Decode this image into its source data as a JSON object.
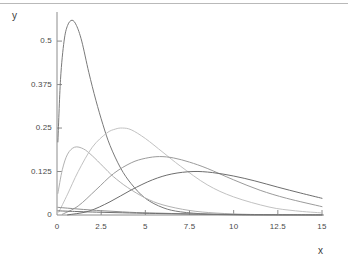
{
  "figure": {
    "background_color": "#ffffff",
    "top_rule_color": "#b9b9b9",
    "axis_color": "#8c8c8c"
  },
  "axes": {
    "x_title": "x",
    "y_title": "y",
    "x_ticks": [
      "0",
      "2.5",
      "5",
      "7.5",
      "10",
      "12.5",
      "15"
    ],
    "y_ticks": [
      "0",
      "0.125",
      "0.25",
      "0.375",
      "0.5"
    ]
  },
  "chart_data": {
    "type": "line",
    "title": "",
    "subtitle": "",
    "xlabel": "x",
    "ylabel": "y",
    "xlim": [
      0,
      15
    ],
    "ylim": [
      0,
      0.575
    ],
    "xticks": [
      0,
      2.5,
      5,
      7.5,
      10,
      12.5,
      15
    ],
    "yticks": [
      0,
      0.125,
      0.25,
      0.375,
      0.5
    ],
    "grid": false,
    "legend": "none",
    "annotations": [],
    "series": [
      {
        "name": "k = 2",
        "color": "#7a7a7a",
        "peak_x": 0.85,
        "peak_y": 0.56,
        "values_x": [
          0.05,
          0.2,
          0.4,
          0.6,
          0.85,
          1.1,
          1.4,
          1.8,
          2.2,
          2.6,
          3.0,
          3.6,
          4.2,
          5.0,
          6.0,
          7.0,
          8.5,
          10.0,
          12.0,
          15.0
        ],
        "values_y": [
          0.21,
          0.39,
          0.5,
          0.545,
          0.56,
          0.545,
          0.5,
          0.41,
          0.33,
          0.26,
          0.2,
          0.135,
          0.09,
          0.048,
          0.021,
          0.009,
          0.0026,
          0.0007,
          0.0001,
          0.0
        ]
      },
      {
        "name": "k = 3",
        "color": "#b2b2b2",
        "peak_x": 1.0,
        "peak_y": 0.242,
        "values_x": [
          0.05,
          0.3,
          0.6,
          1.0,
          1.5,
          2.0,
          2.6,
          3.2,
          4.0,
          5.0,
          6.0,
          7.5,
          9.0,
          11.0,
          13.0,
          15.0
        ],
        "values_y": [
          0.062,
          0.13,
          0.175,
          0.195,
          0.19,
          0.17,
          0.14,
          0.11,
          0.079,
          0.049,
          0.029,
          0.013,
          0.0056,
          0.0016,
          0.0004,
          0.0001
        ]
      },
      {
        "name": "k = 5",
        "color": "#c2c2c2",
        "peak_x": 3.7,
        "peak_y": 0.25,
        "values_x": [
          0.1,
          0.6,
          1.2,
          2.0,
          2.8,
          3.3,
          3.7,
          4.2,
          5.0,
          6.0,
          7.0,
          8.5,
          10.0,
          12.0,
          13.5,
          15.0
        ],
        "values_y": [
          0.008,
          0.06,
          0.125,
          0.195,
          0.235,
          0.247,
          0.25,
          0.245,
          0.22,
          0.18,
          0.14,
          0.087,
          0.052,
          0.023,
          0.012,
          0.006
        ]
      },
      {
        "name": "k = 7",
        "color": "#9b9b9b",
        "peak_x": 5.8,
        "peak_y": 0.168,
        "values_x": [
          0.3,
          1.2,
          2.2,
          3.2,
          4.2,
          5.0,
          5.8,
          6.6,
          7.5,
          8.5,
          10.0,
          11.5,
          13.0,
          15.0
        ],
        "values_y": [
          0.002,
          0.026,
          0.072,
          0.119,
          0.15,
          0.163,
          0.168,
          0.164,
          0.152,
          0.134,
          0.101,
          0.071,
          0.048,
          0.024
        ]
      },
      {
        "name": "k = 9",
        "color": "#6e6e6e",
        "peak_x": 7.7,
        "peak_y": 0.125,
        "values_x": [
          0.6,
          1.8,
          3.0,
          4.2,
          5.4,
          6.5,
          7.7,
          8.8,
          10.0,
          11.2,
          12.5,
          13.8,
          15.0
        ],
        "values_y": [
          0.0004,
          0.011,
          0.038,
          0.072,
          0.101,
          0.118,
          0.125,
          0.122,
          0.112,
          0.098,
          0.08,
          0.063,
          0.048
        ]
      },
      {
        "name": "baseline-tail-a",
        "color": "#8f8f8f",
        "peak_x": 0.0,
        "peak_y": 0.022,
        "values_x": [
          0.05,
          1.0,
          2.0,
          3.0,
          4.5,
          6.0,
          8.0,
          10.0,
          12.0,
          15.0
        ],
        "values_y": [
          0.022,
          0.018,
          0.014,
          0.011,
          0.007,
          0.005,
          0.0025,
          0.0012,
          0.0006,
          0.0002
        ]
      },
      {
        "name": "baseline-tail-b",
        "color": "#707070",
        "peak_x": 0.0,
        "peak_y": 0.012,
        "values_x": [
          0.05,
          1.0,
          2.0,
          3.0,
          4.5,
          6.0,
          8.0,
          10.0,
          12.0,
          15.0
        ],
        "values_y": [
          0.012,
          0.0102,
          0.0086,
          0.0072,
          0.0054,
          0.004,
          0.0025,
          0.0015,
          0.0009,
          0.0004
        ]
      }
    ]
  }
}
